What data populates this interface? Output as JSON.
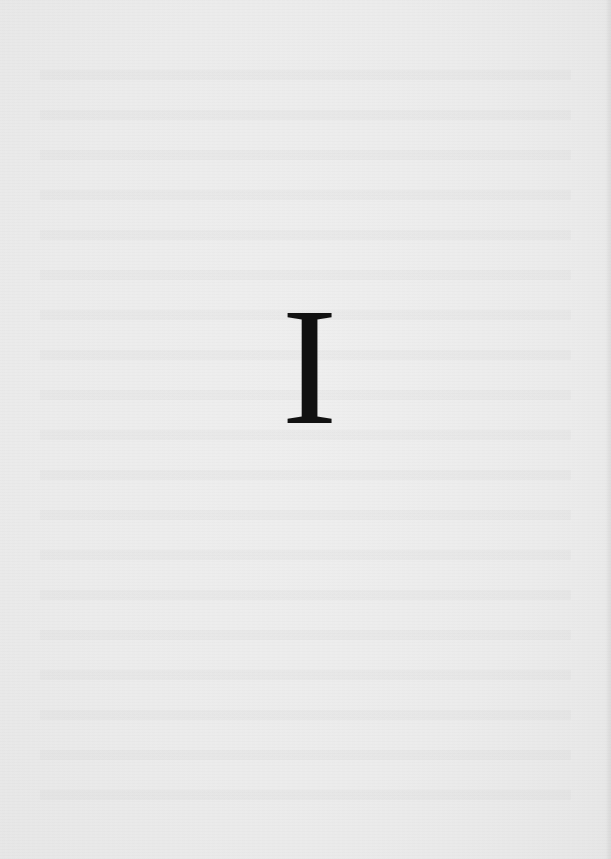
{
  "page": {
    "type": "part-divider",
    "numeral": "I",
    "colors": {
      "paper": "#ebebeb",
      "ink": "#111111"
    }
  }
}
